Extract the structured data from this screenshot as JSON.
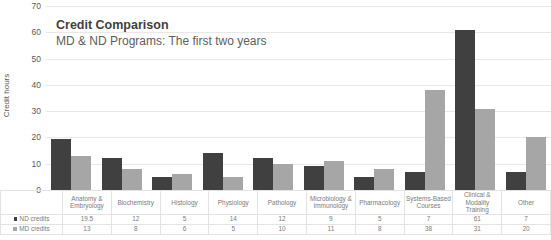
{
  "chart_data": {
    "type": "bar",
    "title": "Credit Comparison",
    "subtitle": "MD & ND Programs: The first two years",
    "xlabel": "",
    "ylabel": "Credit hours",
    "ylim": [
      0,
      70
    ],
    "ytick_step": 10,
    "yticks": [
      "70",
      "60",
      "50",
      "40",
      "30",
      "20",
      "10",
      "0"
    ],
    "grid": true,
    "legend_position": "bottom-left-table",
    "categories": [
      "Anatomy & Embryology",
      "Biochemistry",
      "Histology",
      "Physiology",
      "Pathology",
      "Microbiology & Immunology",
      "Pharmacology",
      "Systems-Based Courses",
      "Clinical & Modality Training",
      "Other"
    ],
    "series": [
      {
        "name": "ND credits",
        "color": "#404040",
        "values": [
          19.5,
          12,
          5,
          14,
          12,
          9,
          5,
          7,
          61,
          7
        ],
        "labels": [
          "19.5",
          "12",
          "5",
          "14",
          "12",
          "9",
          "5",
          "7",
          "61",
          "7"
        ]
      },
      {
        "name": "MD credits",
        "color": "#a6a6a6",
        "values": [
          13,
          8,
          6,
          5,
          10,
          11,
          8,
          38,
          31,
          20
        ],
        "labels": [
          "13",
          "8",
          "6",
          "5",
          "10",
          "11",
          "8",
          "38",
          "31",
          "20"
        ]
      }
    ]
  }
}
